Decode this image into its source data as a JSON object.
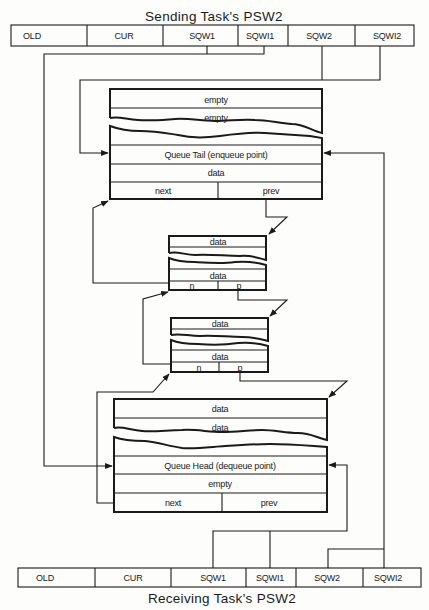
{
  "sending_psw": {
    "title": "Sending Task's PSW2",
    "fields": [
      "OLD",
      "CUR",
      "SQW1",
      "SQWI1",
      "SQW2",
      "SQWI2"
    ]
  },
  "receiving_psw": {
    "title": "Receiving Task's PSW2",
    "fields": [
      "OLD",
      "CUR",
      "SQW1",
      "SQWI1",
      "SQW2",
      "SQWI2"
    ]
  },
  "queue_tail_block": {
    "rows": [
      "empty",
      "empty",
      "Queue Tail (enqueue point)",
      "data"
    ],
    "next": "next",
    "prev": "prev"
  },
  "middle_block_1": {
    "rows": [
      "data",
      "data"
    ],
    "next": "n",
    "prev": "p"
  },
  "middle_block_2": {
    "rows": [
      "data",
      "data"
    ],
    "next": "n",
    "prev": "p"
  },
  "queue_head_block": {
    "rows": [
      "data",
      "data",
      "Queue Head (dequeue point)",
      "empty"
    ],
    "next": "next",
    "prev": "prev"
  }
}
